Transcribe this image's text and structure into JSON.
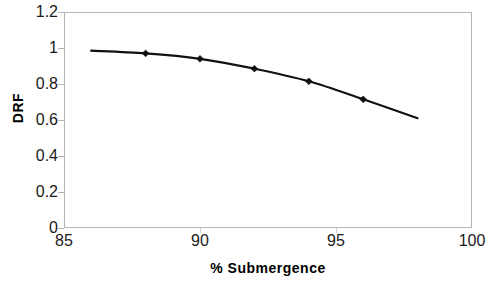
{
  "chart_data": {
    "type": "line",
    "title": "",
    "xlabel": "% Submergence",
    "ylabel": "DRF",
    "xlim": [
      85,
      100
    ],
    "ylim": [
      0,
      1.2
    ],
    "grid": false,
    "legend": null,
    "x_ticks": [
      "85",
      "90",
      "95",
      "100"
    ],
    "x_tick_values": [
      85,
      90,
      95,
      100
    ],
    "y_ticks": [
      "0",
      "0.2",
      "0.4",
      "0.6",
      "0.8",
      "1",
      "1.2"
    ],
    "y_tick_values": [
      0,
      0.2,
      0.4,
      0.6,
      0.8,
      1,
      1.2
    ],
    "series": [
      {
        "name": "DRF",
        "marker": "diamond",
        "color": "#111111",
        "x": [
          86,
          88,
          90,
          92,
          94,
          96,
          98
        ],
        "values": [
          0.985,
          0.97,
          0.94,
          0.885,
          0.815,
          0.715,
          0.61
        ],
        "marker_x": [
          88,
          90,
          92,
          94,
          96
        ],
        "marker_values": [
          0.97,
          0.94,
          0.885,
          0.815,
          0.715
        ]
      }
    ]
  },
  "axes": {
    "y_title": "DRF",
    "x_title": "% Submergence"
  }
}
